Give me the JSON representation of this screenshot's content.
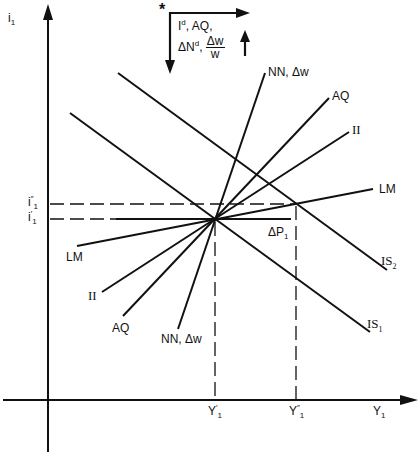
{
  "diagram": {
    "type": "IS-LM diagram (macroeconomics)",
    "axes": {
      "y_label": "i",
      "y_label_sub": "1",
      "x_label": "Y",
      "x_label_sub": "1"
    },
    "interest_ticks": [
      {
        "label": "i",
        "sup": "″",
        "sub": "1",
        "id": "i1_double_prime"
      },
      {
        "label": "i",
        "sup": "′",
        "sub": "1",
        "id": "i1_prime"
      }
    ],
    "output_ticks": [
      {
        "label": "Y",
        "sup": "′",
        "sub": "1",
        "id": "Y1_prime"
      },
      {
        "label": "Y",
        "sup": "″",
        "sub": "1",
        "id": "Y1_double_prime"
      }
    ],
    "curves": {
      "IS1": {
        "label": "IS",
        "sub": "1"
      },
      "IS2": {
        "label": "IS",
        "sub": "2"
      },
      "LM": {
        "label_upper": "LM",
        "label_lower": "LM"
      },
      "II": {
        "label_upper": "II",
        "label_lower": "II"
      },
      "AQ": {
        "label_upper": "AQ",
        "label_lower": "AQ"
      },
      "NN": {
        "label_upper": "NN, Δw",
        "label_lower": "NN, Δw"
      }
    },
    "delta_p": {
      "label": "ΔP",
      "sub": "1"
    },
    "inset": {
      "star": "*",
      "line1_a": "I",
      "line1_a_sup": "d",
      "line1_b": ", AQ,",
      "line2_a": "ΔN",
      "line2_a_sup": "d",
      "line2_comma": ",",
      "frac_num": "Δw",
      "frac_den": "w"
    }
  }
}
